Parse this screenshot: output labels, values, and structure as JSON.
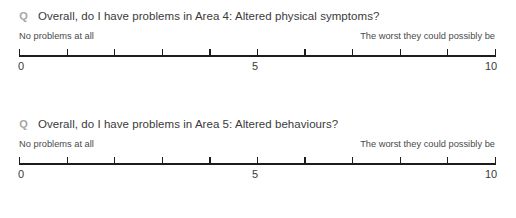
{
  "page": {
    "background_color": "#ffffff",
    "text_color": "#3a3a3a",
    "marker_color": "#a6a6a6",
    "rule_color": "#1c1c1c"
  },
  "questions": [
    {
      "marker": "Q",
      "marker_icon": "question-marker-icon",
      "text": "Overall, do I have problems in Area 4: Altered physical symptoms?",
      "scale": {
        "anchor_low": "No problems at all",
        "anchor_high": "The worst they could possibly be",
        "min_label": "0",
        "mid_label": "5",
        "max_label": "10",
        "min": 0,
        "max": 10,
        "tick_count": 11
      }
    },
    {
      "marker": "Q",
      "marker_icon": "question-marker-icon",
      "text": "Overall, do I have problems in Area 5: Altered behaviours?",
      "scale": {
        "anchor_low": "No problems at all",
        "anchor_high": "The worst they could possibly be",
        "min_label": "0",
        "mid_label": "5",
        "max_label": "10",
        "min": 0,
        "max": 10,
        "tick_count": 11
      }
    }
  ]
}
